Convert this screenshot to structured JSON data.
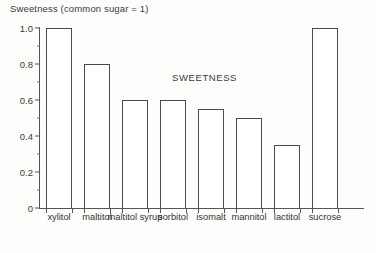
{
  "chart_data": {
    "type": "bar",
    "title": "Sweetness (common sugar = 1)",
    "annotation": "SWEETNESS",
    "xlabel": "",
    "ylabel": "",
    "ylim": [
      0,
      1.0
    ],
    "grid": false,
    "legend": "none",
    "y_major_ticks": [
      "0",
      "0.2",
      "0.4",
      "0.6",
      "0.8",
      "1.0"
    ],
    "y_major_values": [
      0,
      0.2,
      0.4,
      0.6,
      0.8,
      1.0
    ],
    "y_minor_values": [
      0.1,
      0.3,
      0.5,
      0.7,
      0.9
    ],
    "categories": [
      "xylitol",
      "maltitol",
      "maltitol syrup",
      "sorbitol",
      "isomalt",
      "mannitol",
      "lactitol",
      "sucrose"
    ],
    "values": [
      1.0,
      0.8,
      0.6,
      0.6,
      0.55,
      0.5,
      0.35,
      1.0
    ],
    "bar_fill": "#ffffff",
    "bar_stroke": "#4a4a4a",
    "axis_color": "#555555",
    "text_color": "#333333"
  }
}
